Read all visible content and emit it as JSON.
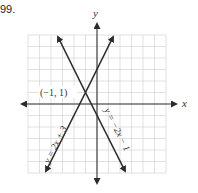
{
  "problem": {
    "number": "99."
  },
  "chart_data": {
    "type": "line",
    "title": "",
    "xlabel": "x",
    "ylabel": "y",
    "xlim": [
      -6,
      6
    ],
    "ylim": [
      -6,
      6
    ],
    "grid": true,
    "tick_labels": false,
    "series": [
      {
        "name": "y = 2x + 3",
        "slope": 2,
        "intercept": 3,
        "x": [
          -4.4,
          1.4
        ],
        "y": [
          -5.8,
          5.8
        ]
      },
      {
        "name": "y = −2x − 1",
        "slope": -2,
        "intercept": -1,
        "x": [
          -3.4,
          2.4
        ],
        "y": [
          5.8,
          -5.8
        ]
      }
    ],
    "annotations": [
      {
        "text": "(−1, 1)",
        "x": -1,
        "y": 1,
        "type": "intersection-point"
      }
    ]
  },
  "labels": {
    "x_axis": "x",
    "y_axis": "y",
    "point": "(−1, 1)",
    "line1": "y = 2x + 3",
    "line2": "y = −2x − 1"
  }
}
